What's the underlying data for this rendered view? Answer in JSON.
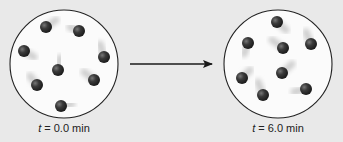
{
  "colors": {
    "background": "#e9e9e9",
    "container_fill": "#fbfbfb",
    "container_stroke": "#222222",
    "particle": "#2e2e2e",
    "particle_highlight": "#6a6a6a",
    "trail": "#cfcfcf",
    "arrow": "#1a1a1a"
  },
  "panels": [
    {
      "id": "initial",
      "caption_var": "t",
      "caption_rest": " = 0.0 min",
      "container": {
        "cx": 64,
        "cy": 64,
        "r": 54
      },
      "particles": [
        {
          "x": 46,
          "y": 27,
          "tx": 56,
          "ty": 20
        },
        {
          "x": 79,
          "y": 31,
          "tx": 70,
          "ty": 27
        },
        {
          "x": 24,
          "y": 51,
          "tx": 34,
          "ty": 57
        },
        {
          "x": 104,
          "y": 57,
          "tx": 100,
          "ty": 44
        },
        {
          "x": 58,
          "y": 70,
          "tx": 60,
          "ty": 58
        },
        {
          "x": 94,
          "y": 80,
          "tx": 84,
          "ty": 72
        },
        {
          "x": 37,
          "y": 85,
          "tx": 30,
          "ty": 76
        },
        {
          "x": 61,
          "y": 106,
          "tx": 72,
          "ty": 104
        }
      ]
    },
    {
      "id": "final",
      "caption_var": "t",
      "caption_rest": " = 6.0 min",
      "container": {
        "cx": 278,
        "cy": 64,
        "r": 54
      },
      "particles": [
        {
          "x": 277,
          "y": 22,
          "tx": 286,
          "ty": 30
        },
        {
          "x": 248,
          "y": 43,
          "tx": 244,
          "ty": 54
        },
        {
          "x": 283,
          "y": 48,
          "tx": 272,
          "ty": 40
        },
        {
          "x": 311,
          "y": 44,
          "tx": 306,
          "ty": 32
        },
        {
          "x": 242,
          "y": 78,
          "tx": 250,
          "ty": 70
        },
        {
          "x": 282,
          "y": 73,
          "tx": 292,
          "ty": 64
        },
        {
          "x": 263,
          "y": 95,
          "tx": 258,
          "ty": 82
        },
        {
          "x": 306,
          "y": 89,
          "tx": 294,
          "ty": 92
        }
      ]
    }
  ],
  "arrow": {
    "x1": 130,
    "y1": 64,
    "x2": 212,
    "y2": 64
  },
  "captions": {
    "initial": {
      "var": "t",
      "rest": " = 0.0 min",
      "x": 4,
      "y": 122
    },
    "final": {
      "var": "t",
      "rest": " = 6.0 min",
      "x": 218,
      "y": 122
    }
  }
}
